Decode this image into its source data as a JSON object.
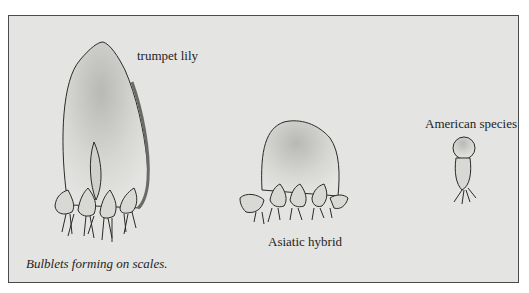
{
  "figure": {
    "caption": "Bulblets forming on scales.",
    "labels": {
      "trumpet": "trumpet lily",
      "asiatic": "Asiatic hybrid",
      "american": "American species"
    },
    "colors": {
      "background": "#ffffff",
      "panel": "#e4e4e2",
      "border": "#4a4a4a",
      "ink": "#2a2a2a"
    }
  }
}
